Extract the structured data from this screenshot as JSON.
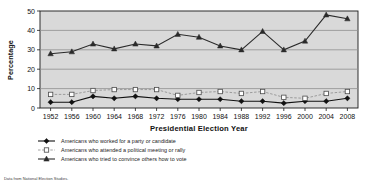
{
  "chart_data": {
    "type": "line",
    "title": "",
    "xlabel": "Presidential Election Year",
    "ylabel": "Percentage",
    "ylim": [
      0,
      50
    ],
    "yticks": [
      0,
      10,
      20,
      30,
      40,
      50
    ],
    "grid": true,
    "legend_position": "below",
    "categories": [
      1952,
      1956,
      1960,
      1964,
      1968,
      1972,
      1976,
      1980,
      1984,
      1988,
      1992,
      1996,
      2000,
      2004,
      2008
    ],
    "series": [
      {
        "name": "Americans who worked for a party or candidate",
        "marker": "filled-diamond",
        "line": "solid",
        "color": "#111111",
        "values": [
          3,
          3,
          6,
          5,
          6,
          5,
          4.5,
          4.5,
          4.5,
          3.5,
          3.5,
          2.5,
          3.5,
          3.5,
          5
        ]
      },
      {
        "name": "Americans who attended a political meeting or rally",
        "marker": "open-square",
        "line": "dashed",
        "color": "#8c8c8c",
        "values": [
          7,
          7,
          9,
          9.5,
          9.5,
          9.5,
          6.5,
          8,
          8.5,
          7.5,
          8.5,
          5.5,
          5,
          7.5,
          8.5
        ]
      },
      {
        "name": "Americans who tried to convince others how to vote",
        "marker": "filled-triangle",
        "line": "solid",
        "color": "#2a2a2a",
        "values": [
          28,
          29,
          33,
          30.5,
          33,
          32,
          38,
          36.5,
          32,
          30,
          39.5,
          30,
          34.5,
          48,
          46
        ]
      }
    ]
  },
  "axis": {
    "y_title": "Percentage",
    "x_title": "Presidential Election Year"
  },
  "legend": {
    "items": [
      {
        "label": "Americans who worked for a party or candidate",
        "marker": "filled-diamond"
      },
      {
        "label": "Americans who attended a political meeting or rally",
        "marker": "open-square"
      },
      {
        "label": "Americans who tried to convince others how to vote",
        "marker": "filled-triangle"
      }
    ]
  },
  "footer": {
    "source": "Data from National Election Studies."
  },
  "colors": {
    "plot_background": "#d9d9d9",
    "gridline": "#8f8f8f",
    "axis": "#1a1a1a",
    "series_work": "#111111",
    "series_meeting": "#8c8c8c",
    "series_convince": "#2a2a2a"
  }
}
